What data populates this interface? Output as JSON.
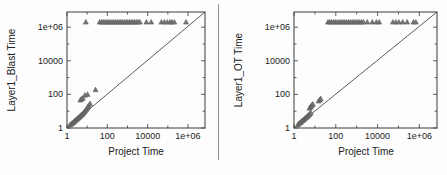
{
  "style": {
    "background": "#fdfdfd",
    "frame_color": "#3a3a3a",
    "text_color": "#222222",
    "diagonal_color": "#4a4a4a",
    "marker_fill": "#757575",
    "marker_stroke": "#565656",
    "divider_color": "#8f8f8f"
  },
  "chart_data": [
    {
      "type": "scatter",
      "title": "",
      "xlabel": "Project Time",
      "ylabel": "Layer1_Blast Time",
      "xscale": "log",
      "yscale": "log",
      "xlim": [
        1,
        7000000
      ],
      "ylim": [
        1,
        8000000
      ],
      "grid": false,
      "legend": "none",
      "diagonal_reference_line": true,
      "marker": "triangle",
      "xticks": [
        1,
        100,
        10000,
        1000000
      ],
      "xtick_labels": [
        "1",
        "100",
        "10000",
        "1e+06"
      ],
      "yticks": [
        1,
        100,
        10000,
        1000000
      ],
      "ytick_labels": [
        "1",
        "100",
        "10000",
        "1e+06"
      ],
      "series": [
        {
          "name": "timeout-band",
          "y_constant": 2000000,
          "x": [
            8.6,
            42,
            52,
            63,
            78,
            95,
            115,
            140,
            170,
            210,
            255,
            310,
            380,
            460,
            560,
            690,
            840,
            1020,
            1250,
            1520,
            1850,
            2260,
            2750,
            3350,
            4100,
            8700,
            15000,
            48000,
            68000,
            95000,
            130000,
            160000,
            210000,
            800000
          ]
        },
        {
          "name": "near-diagonal-cluster",
          "points": [
            [
              1.4,
              1.5
            ],
            [
              1.6,
              1.7
            ],
            [
              1.8,
              1.9
            ],
            [
              2.0,
              2.1
            ],
            [
              2.2,
              2.3
            ],
            [
              2.4,
              2.6
            ],
            [
              2.7,
              2.9
            ],
            [
              3.0,
              3.2
            ],
            [
              3.3,
              3.6
            ],
            [
              3.6,
              4.0
            ],
            [
              4.0,
              4.4
            ],
            [
              4.4,
              4.9
            ],
            [
              4.9,
              5.5
            ],
            [
              5.4,
              6.2
            ],
            [
              6.0,
              7.0
            ],
            [
              6.6,
              7.9
            ],
            [
              7.3,
              9.0
            ],
            [
              8.0,
              10.5
            ],
            [
              9.0,
              12.5
            ],
            [
              10.0,
              15
            ],
            [
              11,
              18
            ],
            [
              12,
              22
            ],
            [
              14,
              28
            ],
            [
              4.6,
              46
            ],
            [
              5.3,
              53
            ],
            [
              6.1,
              60
            ],
            [
              7.7,
              88
            ],
            [
              10.5,
              100
            ],
            [
              26,
              190
            ]
          ]
        }
      ]
    },
    {
      "type": "scatter",
      "title": "",
      "xlabel": "Project Time",
      "ylabel": "Layer1_OT Time",
      "xscale": "log",
      "yscale": "log",
      "xlim": [
        1,
        7000000
      ],
      "ylim": [
        1,
        8000000
      ],
      "grid": false,
      "legend": "none",
      "diagonal_reference_line": true,
      "marker": "triangle",
      "xticks": [
        1,
        100,
        10000,
        1000000
      ],
      "xtick_labels": [
        "1",
        "100",
        "10000",
        "1e+06"
      ],
      "yticks": [
        1,
        100,
        10000,
        1000000
      ],
      "ytick_labels": [
        "1",
        "100",
        "10000",
        "1e+06"
      ],
      "series": [
        {
          "name": "timeout-band",
          "y_constant": 2000000,
          "x": [
            42,
            52,
            64,
            79,
            97,
            119,
            146,
            180,
            220,
            270,
            330,
            410,
            500,
            615,
            755,
            930,
            1140,
            1400,
            1720,
            2110,
            3200,
            5600,
            8800,
            12000,
            54000,
            75000,
            105000,
            160000,
            260000,
            520000,
            680000
          ]
        },
        {
          "name": "near-diagonal-cluster",
          "points": [
            [
              1.5,
              1.5
            ],
            [
              1.7,
              1.8
            ],
            [
              1.9,
              2.0
            ],
            [
              2.1,
              2.2
            ],
            [
              2.3,
              2.5
            ],
            [
              2.6,
              2.8
            ],
            [
              2.9,
              3.1
            ],
            [
              3.2,
              3.5
            ],
            [
              3.5,
              3.9
            ],
            [
              3.9,
              4.3
            ],
            [
              4.3,
              4.8
            ],
            [
              4.7,
              5.4
            ],
            [
              5.2,
              6.1
            ],
            [
              5.7,
              7.0
            ],
            [
              6.3,
              8.0
            ],
            [
              5.5,
              15
            ],
            [
              6.0,
              17
            ],
            [
              6.6,
              20
            ],
            [
              7.2,
              23
            ],
            [
              8.0,
              26
            ],
            [
              15,
              40
            ],
            [
              17,
              47
            ],
            [
              19,
              55
            ]
          ]
        }
      ]
    }
  ]
}
